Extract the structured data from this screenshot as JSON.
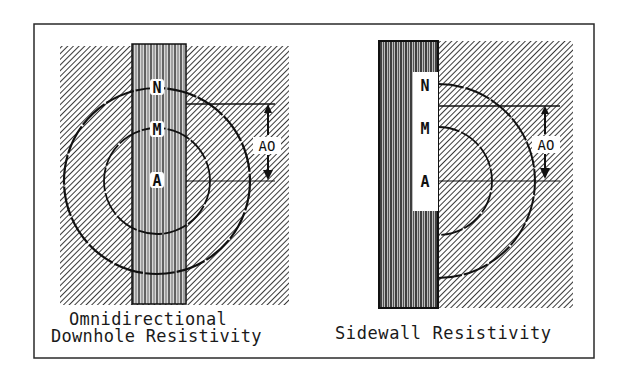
{
  "figure": {
    "background": "#ffffff",
    "frame_color": "#2a2a2a",
    "hatch_color": "#3a3a3a",
    "line_color": "#111111"
  },
  "left_panel": {
    "title_line1": "Omnidirectional",
    "title_line2": "Downhole Resistivity",
    "electrodes": [
      {
        "label": "N"
      },
      {
        "label": "M"
      },
      {
        "label": "A"
      }
    ],
    "spacing_label": "AO"
  },
  "right_panel": {
    "title": "Sidewall Resistivity",
    "electrodes": [
      {
        "label": "N"
      },
      {
        "label": "M"
      },
      {
        "label": "A"
      }
    ],
    "spacing_label": "AO"
  }
}
